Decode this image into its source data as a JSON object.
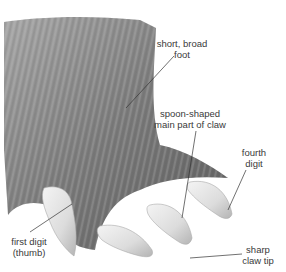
{
  "diagram": {
    "labels": [
      {
        "id": "short-broad-foot",
        "lines": [
          "short, broad",
          "foot"
        ],
        "x": 182,
        "y": 44
      },
      {
        "id": "spoon-shaped-claw",
        "lines": [
          "spoon-shaped",
          "main part of claw"
        ],
        "x": 186,
        "y": 110
      },
      {
        "id": "fourth-digit",
        "lines": [
          "fourth",
          "digit"
        ],
        "x": 255,
        "y": 148
      },
      {
        "id": "first-digit-thumb",
        "lines": [
          "first digit",
          "(thumb)"
        ],
        "x": 28,
        "y": 236
      },
      {
        "id": "sharp-claw-tip",
        "lines": [
          "sharp",
          "claw tip"
        ],
        "x": 256,
        "y": 244
      }
    ],
    "colors": {
      "background": "#ffffff",
      "fur_dark": "#5a5a5a",
      "fur_light": "#9a9a9a",
      "claw": "#e8e8e8",
      "claw_shadow": "#b8b8b8",
      "leader_line": "#333333",
      "text": "#3a3a3a"
    }
  }
}
